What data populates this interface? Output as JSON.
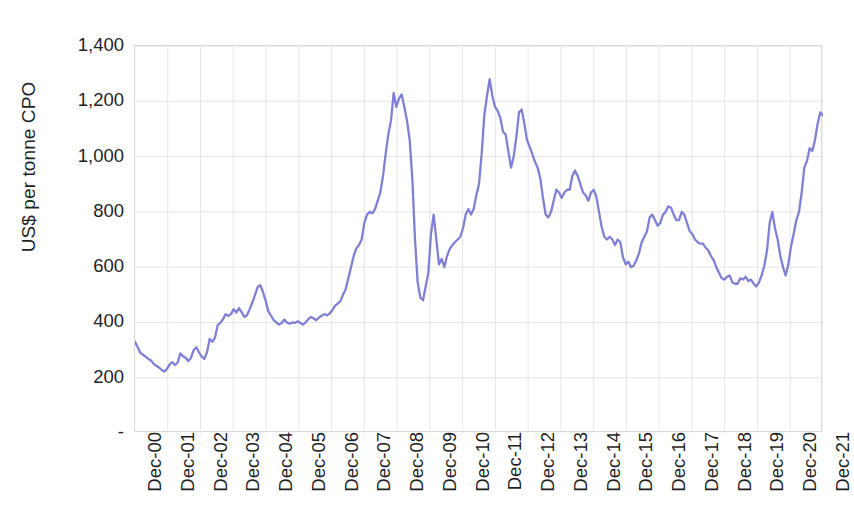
{
  "chart_data": {
    "type": "line",
    "title": "",
    "subtitle": "",
    "xlabel": "",
    "ylabel": "US$ per tonne CPO",
    "ylim": [
      0,
      1400
    ],
    "y_ticks": [
      0,
      200,
      400,
      600,
      800,
      1000,
      1200,
      1400
    ],
    "y_tick_labels": [
      "-",
      "200",
      "400",
      "600",
      "800",
      "1,000",
      "1,200",
      "1,400"
    ],
    "grid": true,
    "grid_axes": "both",
    "legend": "none",
    "x_tick_labels": [
      "Dec-00",
      "Dec-01",
      "Dec-02",
      "Dec-03",
      "Dec-04",
      "Dec-05",
      "Dec-06",
      "Dec-07",
      "Dec-08",
      "Dec-09",
      "Dec-10",
      "Dec-11",
      "Dec-12",
      "Dec-13",
      "Dec-14",
      "Dec-15",
      "Dec-16",
      "Dec-17",
      "Dec-18",
      "Dec-19",
      "Dec-20",
      "Dec-21"
    ],
    "x_start": "Dec-00",
    "x_end": "Dec-21",
    "x_frequency": "monthly",
    "line_color": "#8180d4",
    "line_width": 2.3,
    "series": [
      {
        "name": "CPO price",
        "units": "US$ per tonne",
        "values": [
          330,
          310,
          290,
          283,
          276,
          268,
          262,
          250,
          243,
          237,
          228,
          222,
          232,
          248,
          256,
          246,
          255,
          288,
          278,
          272,
          260,
          272,
          300,
          310,
          292,
          276,
          268,
          292,
          340,
          330,
          345,
          390,
          398,
          412,
          430,
          424,
          430,
          448,
          436,
          452,
          437,
          420,
          426,
          448,
          472,
          500,
          528,
          535,
          510,
          478,
          440,
          425,
          408,
          400,
          392,
          398,
          410,
          400,
          395,
          400,
          398,
          404,
          398,
          392,
          400,
          412,
          420,
          414,
          408,
          418,
          424,
          430,
          426,
          432,
          444,
          460,
          468,
          476,
          500,
          520,
          560,
          600,
          640,
          668,
          680,
          700,
          760,
          790,
          800,
          795,
          810,
          840,
          870,
          930,
          1010,
          1080,
          1130,
          1230,
          1180,
          1210,
          1225,
          1180,
          1130,
          1060,
          920,
          700,
          545,
          490,
          480,
          530,
          580,
          720,
          790,
          700,
          610,
          630,
          600,
          640,
          665,
          680,
          690,
          700,
          710,
          740,
          790,
          810,
          790,
          810,
          860,
          900,
          1010,
          1150,
          1220,
          1280,
          1220,
          1180,
          1165,
          1140,
          1090,
          1080,
          1020,
          960,
          1000,
          1070,
          1160,
          1170,
          1120,
          1060,
          1035,
          1010,
          980,
          960,
          920,
          850,
          790,
          780,
          800,
          840,
          880,
          870,
          850,
          870,
          880,
          880,
          930,
          950,
          930,
          900,
          870,
          860,
          840,
          870,
          880,
          855,
          800,
          745,
          710,
          700,
          710,
          700,
          680,
          700,
          690,
          635,
          610,
          620,
          600,
          605,
          625,
          650,
          690,
          710,
          730,
          780,
          790,
          770,
          750,
          760,
          790,
          800,
          820,
          815,
          790,
          770,
          770,
          800,
          790,
          760,
          730,
          720,
          700,
          690,
          685,
          685,
          670,
          660,
          640,
          625,
          600,
          580,
          560,
          555,
          565,
          570,
          545,
          540,
          540,
          560,
          555,
          565,
          550,
          555,
          540,
          530,
          545,
          570,
          605,
          660,
          760,
          800,
          740,
          700,
          640,
          600,
          570,
          610,
          675,
          720,
          770,
          800,
          870,
          960,
          985,
          1030,
          1020,
          1060,
          1120,
          1160,
          1150
        ]
      }
    ]
  }
}
